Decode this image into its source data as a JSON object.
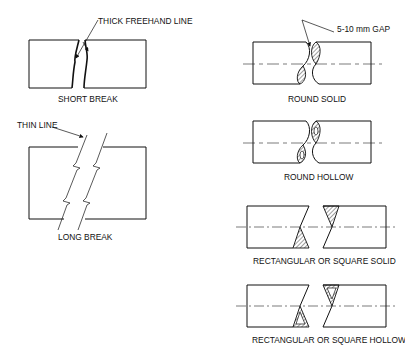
{
  "diagram": {
    "labels": {
      "thick_freehand": "THICK FREEHAND LINE",
      "short_break": "SHORT BREAK",
      "thin_line": "THIN LINE",
      "long_break": "LONG BREAK",
      "gap": "5-10 mm GAP",
      "round_solid": "ROUND SOLID",
      "round_hollow": "ROUND HOLLOW",
      "rect_solid": "RECTANGULAR OR SQUARE  SOLID",
      "rect_hollow": "RECTANGULAR OR SQUARE  HOLLOW"
    },
    "colors": {
      "ink": "#111111",
      "background": "#ffffff"
    }
  }
}
